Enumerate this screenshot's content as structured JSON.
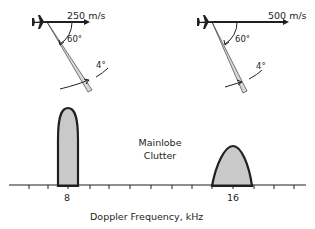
{
  "geometry_left": {
    "speed_label": "250 m/s",
    "angle_label": "60°",
    "beamwidth_label": "4°"
  },
  "geometry_right": {
    "speed_label": "500 m/s",
    "angle_label": "60°",
    "beamwidth_label": "4°"
  },
  "spectrum": {
    "clutter_label_line1": "Mainlobe",
    "clutter_label_line2": "Clutter",
    "tick_label_left": "8",
    "tick_label_right": "16",
    "axis_title": "Doppler Frequency, kHz"
  },
  "colors": {
    "stroke": "#231f20",
    "lobe_fill": "#c9c9c9",
    "beam_fill": "#d9d9d9"
  }
}
